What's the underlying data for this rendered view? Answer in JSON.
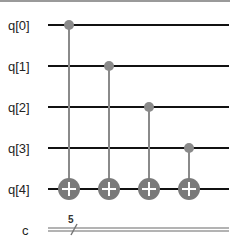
{
  "circuit": {
    "qubits": [
      "q[0]",
      "q[1]",
      "q[2]",
      "q[3]",
      "q[4]"
    ],
    "classical": {
      "label": "c",
      "width": "5"
    },
    "gates": [
      {
        "type": "CNOT",
        "control": "q[0]",
        "target": "q[4]"
      },
      {
        "type": "CNOT",
        "control": "q[1]",
        "target": "q[4]"
      },
      {
        "type": "CNOT",
        "control": "q[2]",
        "target": "q[4]"
      },
      {
        "type": "CNOT",
        "control": "q[3]",
        "target": "q[4]"
      }
    ],
    "colors": {
      "wire": "#111111",
      "gate": "#7a7a7a",
      "classical": "#9a9a9a",
      "plus": "#ffffff"
    }
  }
}
